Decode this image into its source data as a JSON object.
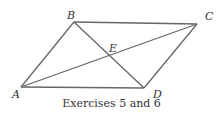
{
  "figure": {
    "points": [
      {
        "name": "A",
        "label": "A"
      },
      {
        "name": "B",
        "label": "B"
      },
      {
        "name": "C",
        "label": "C"
      },
      {
        "name": "D",
        "label": "D"
      },
      {
        "name": "E",
        "label": "E"
      }
    ],
    "segments": [
      "AB",
      "BC",
      "CD",
      "DA",
      "AC",
      "BD"
    ],
    "caption": "Exercises 5 and 6"
  }
}
